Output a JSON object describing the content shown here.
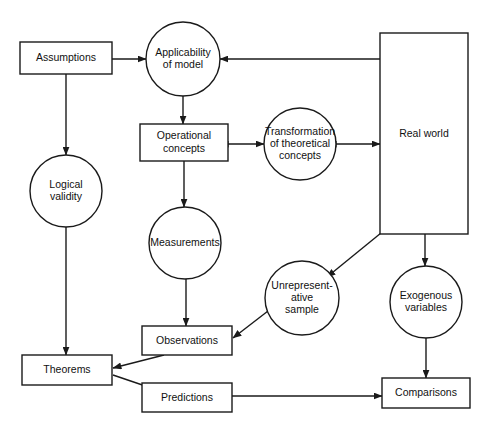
{
  "diagram": {
    "background_color": "#ffffff",
    "stroke_color": "#1a1a1a",
    "fill_color": "#ffffff",
    "nodes": [
      {
        "id": "assumptions",
        "shape": "rect",
        "label": "Assumptions",
        "lines": [
          "Assumptions"
        ],
        "x": 20,
        "y": 42,
        "w": 92,
        "h": 32
      },
      {
        "id": "applicability",
        "shape": "circle",
        "label": "Applicability of model",
        "lines": [
          "Applicability",
          "of model"
        ],
        "cx": 183,
        "cy": 59,
        "r": 37
      },
      {
        "id": "real-world",
        "shape": "rect",
        "label": "Real world",
        "lines": [
          "Real world"
        ],
        "x": 380,
        "y": 33,
        "w": 88,
        "h": 201
      },
      {
        "id": "operational",
        "shape": "rect",
        "label": "Operational concepts",
        "lines": [
          "Operational",
          "concepts"
        ],
        "x": 140,
        "y": 124,
        "w": 88,
        "h": 37
      },
      {
        "id": "transformation",
        "shape": "circle",
        "label": "Transformation of theoretical concepts",
        "lines": [
          "Transformation",
          "of theoretical",
          "concepts"
        ],
        "cx": 300,
        "cy": 144,
        "r": 36
      },
      {
        "id": "logical-validity",
        "shape": "circle",
        "label": "Logical validity",
        "lines": [
          "Logical",
          "validity"
        ],
        "cx": 66,
        "cy": 191,
        "r": 36
      },
      {
        "id": "measurements",
        "shape": "circle",
        "label": "Measurements",
        "lines": [
          "Measurements"
        ],
        "cx": 185,
        "cy": 243,
        "r": 36
      },
      {
        "id": "unrepresentative",
        "shape": "circle",
        "label": "Unrepresentative sample",
        "lines": [
          "Unrepresent-",
          "ative",
          "sample"
        ],
        "cx": 302,
        "cy": 298,
        "r": 37
      },
      {
        "id": "exogenous",
        "shape": "circle",
        "label": "Exogenous variables",
        "lines": [
          "Exogenous",
          "variables"
        ],
        "cx": 426,
        "cy": 302,
        "r": 36
      },
      {
        "id": "observations",
        "shape": "rect",
        "label": "Observations",
        "lines": [
          "Observations"
        ],
        "x": 142,
        "y": 326,
        "w": 90,
        "h": 29
      },
      {
        "id": "theorems",
        "shape": "rect",
        "label": "Theorems",
        "lines": [
          "Theorems"
        ],
        "x": 22,
        "y": 355,
        "w": 90,
        "h": 30
      },
      {
        "id": "predictions",
        "shape": "rect",
        "label": "Predictions",
        "lines": [
          "Predictions"
        ],
        "x": 142,
        "y": 383,
        "w": 90,
        "h": 29
      },
      {
        "id": "comparisons",
        "shape": "rect",
        "label": "Comparisons",
        "lines": [
          "Comparisons"
        ],
        "x": 382,
        "y": 378,
        "w": 88,
        "h": 30
      }
    ],
    "edges": [
      {
        "id": "assumptions-to-applicability",
        "from": "assumptions",
        "to": "applicability",
        "arrow": "single"
      },
      {
        "id": "assumptions-to-logical-validity",
        "from": "assumptions",
        "to": "logical-validity",
        "arrow": "single"
      },
      {
        "id": "real-world-to-applicability",
        "from": "real-world",
        "to": "applicability",
        "arrow": "single"
      },
      {
        "id": "applicability-to-operational",
        "from": "applicability",
        "to": "operational",
        "arrow": "single"
      },
      {
        "id": "operational-transformation",
        "from": "operational",
        "to": "transformation",
        "arrow": "double"
      },
      {
        "id": "transformation-real-world",
        "from": "transformation",
        "to": "real-world",
        "arrow": "double"
      },
      {
        "id": "operational-to-measurements",
        "from": "operational",
        "to": "measurements",
        "arrow": "single"
      },
      {
        "id": "measurements-to-observations",
        "from": "measurements",
        "to": "observations",
        "arrow": "single"
      },
      {
        "id": "logical-validity-to-theorems",
        "from": "logical-validity",
        "to": "theorems",
        "arrow": "single"
      },
      {
        "id": "real-world-to-unrepresentative",
        "from": "real-world",
        "to": "unrepresentative",
        "arrow": "single"
      },
      {
        "id": "unrepresentative-to-observations",
        "from": "unrepresentative",
        "to": "observations",
        "arrow": "single"
      },
      {
        "id": "real-world-to-exogenous",
        "from": "real-world",
        "to": "exogenous",
        "arrow": "single"
      },
      {
        "id": "exogenous-to-comparisons",
        "from": "exogenous",
        "to": "comparisons",
        "arrow": "single"
      },
      {
        "id": "observations-to-theorems",
        "from": "observations",
        "to": "theorems",
        "arrow": "single"
      },
      {
        "id": "theorems-to-predictions",
        "from": "theorems",
        "to": "predictions",
        "arrow": "single"
      },
      {
        "id": "predictions-to-comparisons",
        "from": "predictions",
        "to": "comparisons",
        "arrow": "single"
      }
    ]
  }
}
